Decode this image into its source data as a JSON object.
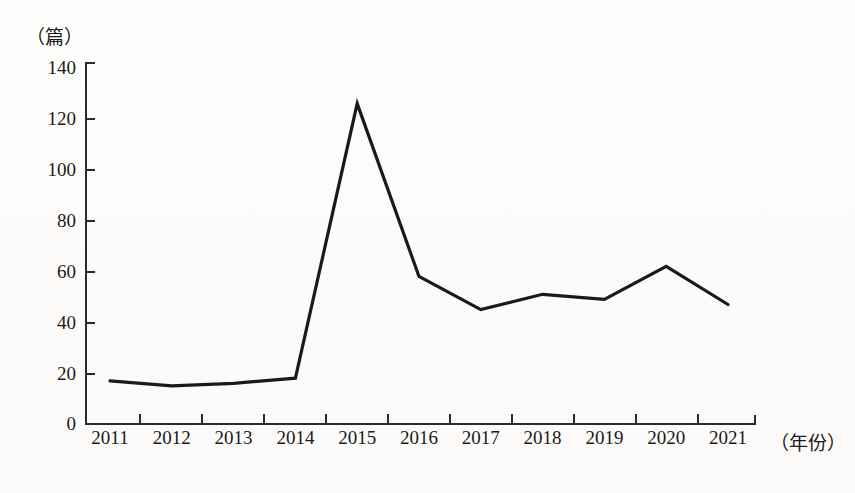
{
  "chart_data": {
    "type": "line",
    "title": "",
    "subtitle": "",
    "xlabel": "（年份）",
    "ylabel": "（篇）",
    "categories": [
      "2011",
      "2012",
      "2013",
      "2014",
      "2015",
      "2016",
      "2017",
      "2018",
      "2019",
      "2020",
      "2021"
    ],
    "values": [
      17,
      15,
      16,
      18,
      126,
      58,
      45,
      51,
      49,
      62,
      47
    ],
    "series": [
      {
        "name": "",
        "values": [
          17,
          15,
          16,
          18,
          126,
          58,
          45,
          51,
          49,
          62,
          47
        ]
      }
    ],
    "ylim": [
      0,
      140
    ],
    "yticks": [
      0,
      20,
      40,
      60,
      80,
      100,
      120,
      140
    ],
    "ytick_labels": [
      "0",
      "20",
      "40",
      "60",
      "80",
      "100",
      "120",
      "140"
    ],
    "xtick_labels": [
      "2011",
      "2012",
      "2013",
      "2014",
      "2015",
      "2016",
      "2017",
      "2018",
      "2019",
      "2020",
      "2021"
    ],
    "grid": false,
    "legend": "none",
    "line_color": "#1a1a1a",
    "axis_color": "#2b2b2b",
    "background_color": "#fdfdfc",
    "markers": false,
    "annotations": []
  },
  "axes": {
    "y_unit": "（篇）",
    "x_unit": "（年份）",
    "y_labels": [
      "140",
      "120",
      "100",
      "80",
      "60",
      "40",
      "20",
      "0"
    ],
    "x_labels": [
      "2011",
      "2012",
      "2013",
      "2014",
      "2015",
      "2016",
      "2017",
      "2018",
      "2019",
      "2020",
      "2021"
    ]
  }
}
